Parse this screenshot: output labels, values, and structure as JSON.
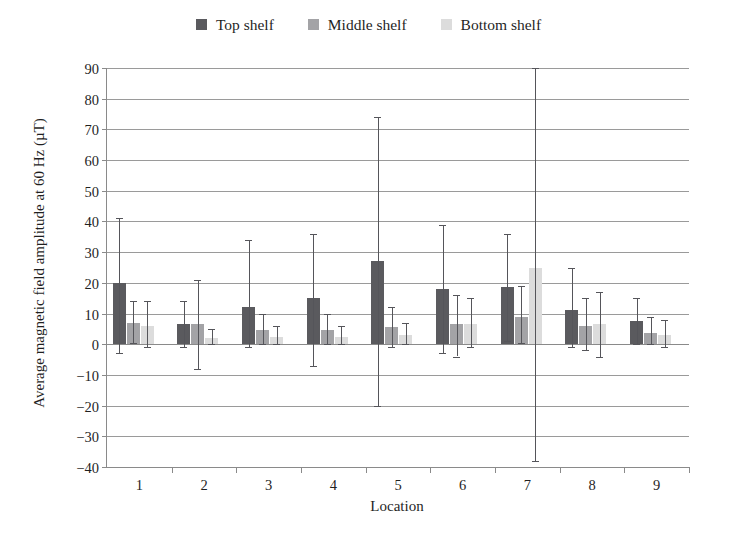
{
  "legend": {
    "position": "top-center",
    "entries": [
      {
        "label": "Top shelf",
        "color": "#5a5a5e",
        "icon": "square-swatch-icon"
      },
      {
        "label": "Middle shelf",
        "color": "#a3a3a6",
        "icon": "square-swatch-icon"
      },
      {
        "label": "Bottom shelf",
        "color": "#dcdcdc",
        "icon": "square-swatch-icon"
      }
    ]
  },
  "axes": {
    "ylabel": "Average magnetic field amplitude at 60 Hz (µT)",
    "xlabel": "Location",
    "yticks": [
      "90",
      "80",
      "70",
      "60",
      "50",
      "40",
      "30",
      "20",
      "10",
      "0",
      "−10",
      "−20",
      "−30",
      "−40"
    ],
    "ytick_values": [
      90,
      80,
      70,
      60,
      50,
      40,
      30,
      20,
      10,
      0,
      -10,
      -20,
      -30,
      -40
    ]
  },
  "chart_data": {
    "type": "bar",
    "title": "",
    "subtitle": "",
    "xlabel": "Location",
    "ylabel": "Average magnetic field amplitude at 60 Hz (µT)",
    "ylim": [
      -40,
      90
    ],
    "ytick_step": 10,
    "grid": true,
    "legend_position": "top-center",
    "error_bars": true,
    "categories": [
      "1",
      "2",
      "3",
      "4",
      "5",
      "6",
      "7",
      "8",
      "9"
    ],
    "series": [
      {
        "name": "Top shelf",
        "color": "#5a5a5e",
        "values": [
          20.0,
          6.5,
          12.0,
          15.0,
          27.0,
          18.0,
          18.5,
          11.0,
          7.5
        ],
        "err_high": [
          41.0,
          14.0,
          34.0,
          36.0,
          74.0,
          39.0,
          36.0,
          25.0,
          15.0
        ],
        "err_low": [
          -3.0,
          -1.0,
          -1.0,
          -7.0,
          -20.0,
          -3.0,
          1.0,
          -1.0,
          0.0
        ]
      },
      {
        "name": "Middle shelf",
        "color": "#a3a3a6",
        "values": [
          7.0,
          6.5,
          4.5,
          4.5,
          5.5,
          6.5,
          9.0,
          6.0,
          3.5
        ],
        "err_high": [
          14.0,
          21.0,
          10.0,
          10.0,
          12.0,
          16.0,
          19.0,
          15.0,
          9.0
        ],
        "err_low": [
          0.5,
          -8.0,
          0.0,
          0.0,
          -1.0,
          -4.0,
          0.5,
          -2.0,
          0.0
        ]
      },
      {
        "name": "Bottom shelf",
        "color": "#dcdcdc",
        "values": [
          6.0,
          2.0,
          2.5,
          2.5,
          3.0,
          6.5,
          25.0,
          6.5,
          3.0
        ],
        "err_high": [
          14.0,
          5.0,
          6.0,
          6.0,
          7.0,
          15.0,
          90.0,
          17.0,
          8.0
        ],
        "err_low": [
          -1.0,
          0.0,
          0.0,
          0.0,
          0.0,
          -1.0,
          -38.0,
          -4.0,
          -1.0
        ]
      }
    ]
  }
}
